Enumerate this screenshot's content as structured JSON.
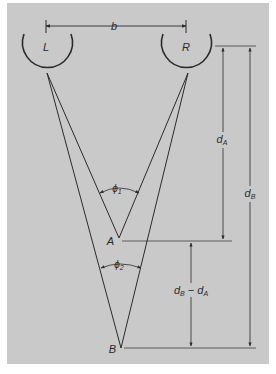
{
  "figure": {
    "panel_color": "#c9c9c9",
    "line_color": "#2b2b2b",
    "labels": {
      "left_eye": "L",
      "right_eye": "R",
      "baseline": "b",
      "point_a": "A",
      "point_b": "B",
      "angle_1": "ϕ",
      "angle_1_sub": "1",
      "angle_2": "ϕ",
      "angle_2_sub": "2",
      "dist_a": "d",
      "dist_a_sub": "A",
      "dist_b": "d",
      "dist_b_sub": "B",
      "diff_d1": "d",
      "diff_d1_sub": "B",
      "diff_minus": " − ",
      "diff_d2": "d",
      "diff_d2_sub": "A"
    }
  }
}
